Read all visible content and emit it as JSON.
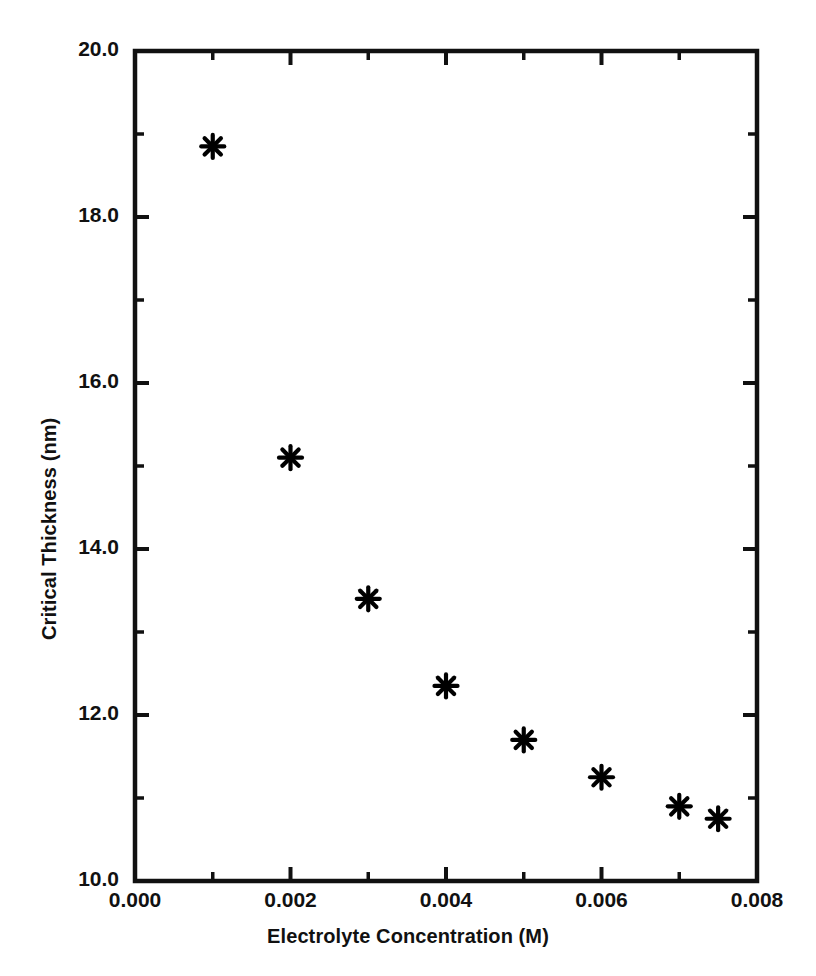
{
  "chart_data": {
    "type": "scatter",
    "title": "",
    "xlabel": "Electrolyte Concentration (M)",
    "ylabel": "Critical Thickness (nm)",
    "xlim": [
      0.0,
      0.008
    ],
    "ylim": [
      10.0,
      20.0
    ],
    "grid": false,
    "legend": null,
    "marker": "asterisk",
    "marker_color": "#000000",
    "series": [
      {
        "name": "Critical thickness vs electrolyte concentration",
        "x": [
          0.001,
          0.002,
          0.003,
          0.004,
          0.005,
          0.006,
          0.007,
          0.0075
        ],
        "y": [
          18.85,
          15.1,
          13.4,
          12.35,
          11.7,
          11.25,
          10.9,
          10.75
        ]
      }
    ],
    "xticks": [
      {
        "value": 0.0,
        "label": "0.000"
      },
      {
        "value": 0.002,
        "label": "0.002"
      },
      {
        "value": 0.004,
        "label": "0.004"
      },
      {
        "value": 0.006,
        "label": "0.006"
      },
      {
        "value": 0.008,
        "label": "0.008"
      }
    ],
    "x_minor_ticks": [
      0.001,
      0.003,
      0.005,
      0.007
    ],
    "yticks": [
      {
        "value": 20.0,
        "label": "20.0"
      },
      {
        "value": 18.0,
        "label": "18.0"
      },
      {
        "value": 16.0,
        "label": "16.0"
      },
      {
        "value": 14.0,
        "label": "14.0"
      },
      {
        "value": 12.0,
        "label": "12.0"
      },
      {
        "value": 10.0,
        "label": "10.0"
      }
    ],
    "y_minor_ticks": [
      19.0,
      17.0,
      15.0,
      13.0,
      11.0
    ]
  },
  "axes": {
    "x_label": "Electrolyte Concentration (M)",
    "y_label": "Critical Thickness (nm)"
  },
  "tick_text": {
    "x": [
      "0.000",
      "0.002",
      "0.004",
      "0.006",
      "0.008"
    ],
    "y": [
      "20.0",
      "18.0",
      "16.0",
      "14.0",
      "12.0",
      "10.0"
    ]
  }
}
